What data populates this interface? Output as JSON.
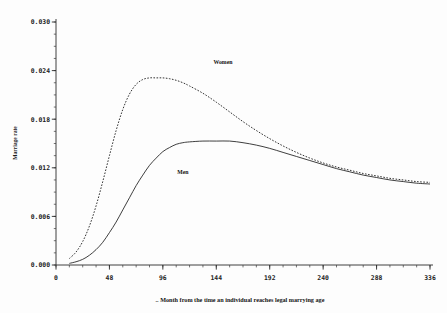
{
  "chart_data": {
    "type": "line",
    "title": "",
    "xlabel": ".. Month from the time an individual reaches legal marrying age",
    "ylabel": "Marriage rate",
    "xlim": [
      0,
      336
    ],
    "ylim": [
      0.0,
      0.03
    ],
    "grid": false,
    "legend_position": "inline-annotations",
    "x_ticks": [
      0,
      48,
      96,
      144,
      192,
      240,
      288,
      336
    ],
    "x_tick_labels": [
      "0",
      "48",
      "96",
      "144",
      "192",
      "240",
      "288",
      "336"
    ],
    "x_minor_step": 12,
    "y_ticks": [
      0.0,
      0.006,
      0.012,
      0.018,
      0.024,
      0.03
    ],
    "y_tick_labels": [
      "0.000",
      "0.006",
      "0.012",
      "0.018",
      "0.024",
      "0.030"
    ],
    "y_minor_step": 0.0015,
    "x": [
      12,
      18,
      24,
      30,
      36,
      42,
      48,
      54,
      60,
      66,
      72,
      78,
      84,
      90,
      96,
      102,
      108,
      114,
      120,
      132,
      144,
      156,
      168,
      180,
      192,
      204,
      216,
      228,
      240,
      252,
      264,
      276,
      288,
      300,
      312,
      324,
      336
    ],
    "series": [
      {
        "name": "Women",
        "style": "dashed",
        "annotation": "Women",
        "annotation_x": 150,
        "annotation_y": 0.0248,
        "peak_x": 105,
        "peak_y": 0.0231,
        "end_y": 0.0102,
        "values": [
          0.0008,
          0.0016,
          0.0029,
          0.0048,
          0.0073,
          0.0103,
          0.0135,
          0.0166,
          0.0192,
          0.0211,
          0.0223,
          0.0229,
          0.0231,
          0.0231,
          0.0231,
          0.023,
          0.0228,
          0.0225,
          0.0221,
          0.0212,
          0.0201,
          0.0189,
          0.0177,
          0.0166,
          0.0156,
          0.0147,
          0.0139,
          0.0132,
          0.0126,
          0.0121,
          0.0117,
          0.0113,
          0.011,
          0.0107,
          0.0105,
          0.0103,
          0.0102
        ]
      },
      {
        "name": "Men",
        "style": "solid",
        "annotation": "Men",
        "annotation_x": 114,
        "annotation_y": 0.0112,
        "peak_x": 160,
        "peak_y": 0.0153,
        "end_y": 0.01,
        "values": [
          0.0002,
          0.0004,
          0.0007,
          0.0012,
          0.0019,
          0.0028,
          0.004,
          0.0053,
          0.0068,
          0.0083,
          0.0098,
          0.0111,
          0.0123,
          0.0132,
          0.014,
          0.0145,
          0.0149,
          0.0151,
          0.0152,
          0.0153,
          0.0153,
          0.0153,
          0.0151,
          0.0148,
          0.0144,
          0.0139,
          0.0134,
          0.0129,
          0.0124,
          0.0119,
          0.0115,
          0.0111,
          0.0108,
          0.0105,
          0.0103,
          0.0101,
          0.01
        ]
      }
    ]
  }
}
